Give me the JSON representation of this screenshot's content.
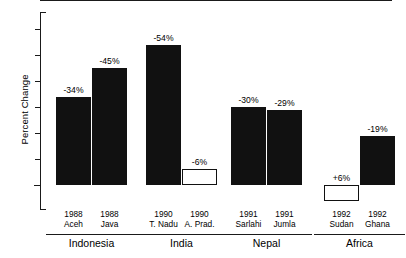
{
  "chart_data": {
    "type": "bar",
    "title": "",
    "xlabel": "",
    "ylabel": "Percent Change",
    "ylim": [
      -60,
      10
    ],
    "grid": false,
    "legend": null,
    "zero_tick_label": "0",
    "y_tick_values": [
      -60,
      -50,
      -40,
      -30,
      -20,
      -10,
      0
    ],
    "categories": [
      {
        "year": "1988",
        "place": "Aceh",
        "group": "Indonesia"
      },
      {
        "year": "1988",
        "place": "Java",
        "group": "Indonesia"
      },
      {
        "year": "1990",
        "place": "T. Nadu",
        "group": "India"
      },
      {
        "year": "1990",
        "place": "A. Prad.",
        "group": "India"
      },
      {
        "year": "1991",
        "place": "Sarlahi",
        "group": "Nepal"
      },
      {
        "year": "1991",
        "place": "Jumla",
        "group": "Nepal"
      },
      {
        "year": "1992",
        "place": "Sudan",
        "group": "Africa"
      },
      {
        "year": "1992",
        "place": "Ghana",
        "group": "Africa"
      }
    ],
    "values": [
      -34,
      -45,
      -54,
      -6,
      -30,
      -29,
      6,
      -19
    ],
    "value_labels": [
      "-34%",
      "-45%",
      "-54%",
      "-6%",
      "-30%",
      "-29%",
      "+6%",
      "-19%"
    ],
    "bar_styles": [
      "filled",
      "filled",
      "filled",
      "hollow",
      "filled",
      "filled",
      "hollow",
      "filled"
    ],
    "groups": [
      {
        "name": "Indonesia",
        "from": 0,
        "to": 1
      },
      {
        "name": "India",
        "from": 2,
        "to": 3
      },
      {
        "name": "Nepal",
        "from": 4,
        "to": 5
      },
      {
        "name": "Africa",
        "from": 6,
        "to": 7
      }
    ],
    "colors": {
      "bar_fill": "#111111",
      "bar_outline": "#111111",
      "axis": "#1a1a1a",
      "background": "#ffffff",
      "text": "#000000"
    }
  }
}
